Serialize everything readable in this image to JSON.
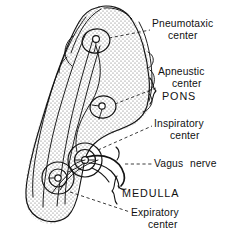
{
  "figure": {
    "background_color": "#ffffff",
    "ink_color": "#141414"
  },
  "labels": {
    "pneumotaxic_line1": "Pneumotaxic",
    "pneumotaxic_line2": "center",
    "apneustic_line1": "Apneustic",
    "apneustic_line2": "center",
    "pons": "PONS",
    "inspiratory_line1": "Inspiratory",
    "inspiratory_line2": "center",
    "vagus": "Vagus",
    "nerve": "nerve",
    "medulla": "MEDULLA",
    "expiratory_line1": "Expiratory",
    "expiratory_line2": "center"
  },
  "structures": {
    "brainstem": "brainstem-outline",
    "stipple": "stipple-texture",
    "nucleus_pneumotaxic": "pneumotaxic-nucleus",
    "nucleus_apneustic": "apneustic-nucleus",
    "nucleus_inspiratory": "inspiratory-nucleus",
    "nucleus_expiratory": "expiratory-nucleus",
    "vagus_nerve": "vagus-nerve-fiber",
    "tracts": "descending-tracts"
  }
}
